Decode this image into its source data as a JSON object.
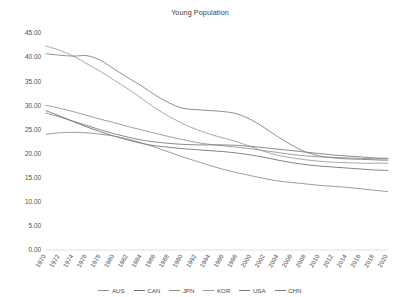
{
  "chart_data": {
    "type": "line",
    "title": "Young Population",
    "xlabel": "",
    "ylabel": "",
    "xlim": [
      1970,
      2020
    ],
    "ylim": [
      0,
      45
    ],
    "ytick_step": 5,
    "grid": false,
    "legend_position": "bottom",
    "ytick_labels": [
      "45.00",
      "40.00",
      "35.00",
      "30.00",
      "25.00",
      "20.00",
      "15.00",
      "10.00",
      "5.00",
      "0.00"
    ],
    "ytick_values": [
      45,
      40,
      35,
      30,
      25,
      20,
      15,
      10,
      5,
      0
    ],
    "x": [
      1970,
      1972,
      1974,
      1976,
      1978,
      1980,
      1982,
      1984,
      1986,
      1988,
      1990,
      1992,
      1994,
      1996,
      1998,
      2000,
      2002,
      2004,
      2006,
      2008,
      2010,
      2012,
      2014,
      2016,
      2018,
      2020
    ],
    "categories": [
      "1970",
      "1972",
      "1974",
      "1976",
      "1978",
      "1980",
      "1982",
      "1984",
      "1986",
      "1988",
      "1990",
      "1992",
      "1994",
      "1996",
      "1998",
      "2000",
      "2002",
      "2004",
      "2006",
      "2008",
      "2010",
      "2012",
      "2014",
      "2016",
      "2018",
      "2020"
    ],
    "series": [
      {
        "name": "AUS",
        "color": "#8f8f8f",
        "values": [
          30.0,
          29.4,
          28.7,
          27.9,
          27.1,
          26.4,
          25.6,
          24.9,
          24.2,
          23.5,
          22.9,
          22.3,
          21.9,
          21.6,
          21.3,
          21.0,
          20.6,
          20.2,
          19.8,
          19.5,
          19.3,
          19.2,
          19.1,
          19.0,
          18.9,
          18.9
        ]
      },
      {
        "name": "CAN",
        "color": "#6e6e6e",
        "values": [
          28.9,
          27.8,
          26.6,
          25.5,
          24.5,
          23.6,
          22.8,
          22.1,
          21.6,
          21.3,
          21.0,
          20.8,
          20.6,
          20.4,
          20.1,
          19.7,
          19.2,
          18.6,
          18.1,
          17.7,
          17.4,
          17.2,
          17.0,
          16.8,
          16.6,
          16.5
        ]
      },
      {
        "name": "JPN",
        "color": "#8a8a8a",
        "values": [
          24.0,
          24.3,
          24.4,
          24.3,
          24.0,
          23.6,
          23.0,
          22.2,
          21.3,
          20.3,
          19.3,
          18.4,
          17.5,
          16.7,
          16.0,
          15.4,
          14.8,
          14.3,
          14.0,
          13.7,
          13.4,
          13.2,
          13.0,
          12.7,
          12.4,
          12.1
        ]
      },
      {
        "name": "KOR",
        "color": "#9a9a9a",
        "values": [
          42.3,
          41.4,
          40.2,
          38.6,
          37.0,
          35.2,
          33.4,
          31.4,
          29.4,
          27.7,
          26.2,
          25.0,
          24.0,
          23.2,
          22.4,
          21.4,
          20.4,
          19.6,
          19.1,
          18.7,
          18.4,
          18.2,
          18.1,
          18.0,
          18.0,
          18.0
        ]
      },
      {
        "name": "USA",
        "color": "#777777",
        "values": [
          28.4,
          27.6,
          26.7,
          25.8,
          24.9,
          24.1,
          23.4,
          22.8,
          22.4,
          22.1,
          21.9,
          21.8,
          21.8,
          21.8,
          21.7,
          21.5,
          21.2,
          20.9,
          20.6,
          20.3,
          20.0,
          19.7,
          19.5,
          19.3,
          19.1,
          19.0
        ]
      },
      {
        "name": "CHN",
        "color": "#7c7c7c",
        "values": [
          40.7,
          40.4,
          40.2,
          40.3,
          39.3,
          37.5,
          35.7,
          34.0,
          32.1,
          30.5,
          29.4,
          29.1,
          28.9,
          28.7,
          28.2,
          27.0,
          25.3,
          23.4,
          21.7,
          20.3,
          19.5,
          19.1,
          18.9,
          18.8,
          18.7,
          18.6
        ]
      }
    ]
  },
  "legend": {
    "items": [
      {
        "label": "AUS"
      },
      {
        "label": "CAN"
      },
      {
        "label": "JPN"
      },
      {
        "label": "KOR"
      },
      {
        "label": "USA"
      },
      {
        "label": "CHN"
      }
    ]
  }
}
